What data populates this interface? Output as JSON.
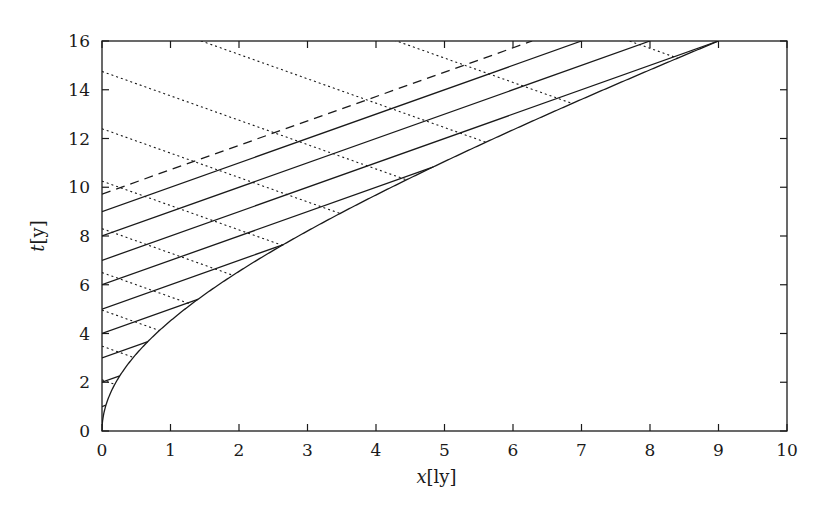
{
  "chart_data": {
    "type": "line",
    "title": "",
    "xlabel": "x[ly]",
    "xlabel_italic": "x",
    "xlabel_unit": "[ly]",
    "ylabel": "t[y]",
    "ylabel_italic": "t",
    "ylabel_unit": "[y]",
    "xlim": [
      0,
      10
    ],
    "ylim": [
      0,
      16
    ],
    "xticks": [
      0,
      1,
      2,
      3,
      4,
      5,
      6,
      7,
      8,
      9,
      10
    ],
    "yticks": [
      0,
      2,
      4,
      6,
      8,
      10,
      12,
      14,
      16
    ],
    "grid": false,
    "legend": null,
    "colors": {
      "line": "#1a1a1a",
      "axis": "#1a1a1a",
      "background": "#ffffff"
    },
    "worldline": {
      "name": "accelerated observer (hyperbola)",
      "style": "solid",
      "horizon_distance": 9.72,
      "description": "x = sqrt(A^2 + t^2) - A, A = 9.72, from t=0 to t=16",
      "t_range": [
        0,
        16
      ]
    },
    "light_signals": {
      "name": "signals emitted from x=0 (slope +1)",
      "style": "solid",
      "emission_times": [
        1,
        2,
        3,
        4,
        5,
        6,
        7,
        8,
        9
      ]
    },
    "horizon_signal": {
      "name": "horizon light ray",
      "style": "dashed",
      "emission_time": 9.72
    },
    "return_signals": {
      "name": "returning signals (slope -1)",
      "style": "dotted",
      "t_intercepts": [
        2.1,
        3.48,
        4.96,
        6.5,
        8.3,
        10.25,
        12.4,
        14.75,
        17.45,
        20.3,
        23.7
      ]
    }
  }
}
